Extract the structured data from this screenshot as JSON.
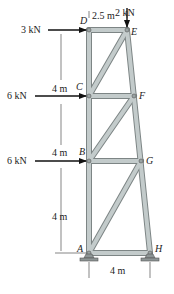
{
  "loads": {
    "top": "2 kN",
    "d": "3 kN",
    "c": "6 kN",
    "b": "6 kN"
  },
  "dimensions": {
    "top_width": "2.5 m",
    "h1": "4 m",
    "h2": "4 m",
    "h3": "4 m",
    "base_width": "4 m"
  },
  "nodes": {
    "A": "A",
    "B": "B",
    "C": "C",
    "D": "D",
    "E": "E",
    "F": "F",
    "G": "G",
    "H": "H"
  },
  "colors": {
    "member": "#b9c1c1",
    "member_edge": "#7d8585",
    "arrow": "#111111"
  }
}
